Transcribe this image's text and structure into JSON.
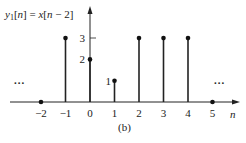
{
  "chart_data": {
    "type": "stem",
    "title": "y1[n] = x[n − 2]",
    "title_parts": {
      "y": "y",
      "sub": "1",
      "rest": "[n] = x[n − 2]"
    },
    "caption": "(b)",
    "xlabel": "n",
    "ylabel": "",
    "x": [
      -2,
      -1,
      0,
      1,
      2,
      3,
      4,
      5
    ],
    "values": [
      0,
      3,
      2,
      1,
      3,
      3,
      3,
      0
    ],
    "x_ticks": [
      "−2",
      "−1",
      "0",
      "1",
      "2",
      "3",
      "4",
      "5"
    ],
    "y_ticks": [
      "1",
      "2",
      "3"
    ],
    "ellipsis_left": "...",
    "ellipsis_right": "...",
    "xlim": [
      -3.5,
      6
    ],
    "ylim": [
      0,
      3.5
    ],
    "grid": false
  }
}
